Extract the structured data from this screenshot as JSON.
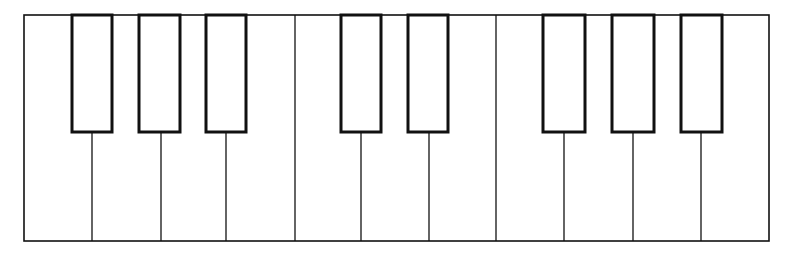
{
  "diagram": {
    "frame": {
      "x": 24,
      "y": 15,
      "width": 745,
      "height": 226
    },
    "colors": {
      "line": "#111111",
      "background": "#ffffff",
      "key_fill": "#ffffff"
    },
    "white_key_dividers": [
      92,
      161,
      226,
      295,
      361,
      429,
      496,
      564,
      633,
      701
    ],
    "black_key_bottom": 132,
    "black_keys": [
      {
        "x": 72,
        "w": 40
      },
      {
        "x": 139,
        "w": 41
      },
      {
        "x": 206,
        "w": 40
      },
      {
        "x": 341,
        "w": 40
      },
      {
        "x": 408,
        "w": 40
      },
      {
        "x": 543,
        "w": 42
      },
      {
        "x": 612,
        "w": 42
      },
      {
        "x": 681,
        "w": 41
      }
    ]
  }
}
